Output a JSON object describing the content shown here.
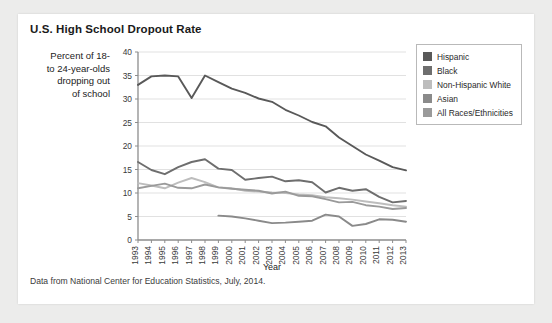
{
  "card": {
    "title": "U.S. High School Dropout Rate",
    "ylabel_line1": "Percent of 18-",
    "ylabel_line2": "to 24-year-olds",
    "ylabel_line3": "dropping out",
    "ylabel_line4": "of school",
    "footnote": "Data from National Center for Education Statistics, July, 2014."
  },
  "legend": {
    "items": [
      {
        "label": "Hispanic",
        "color": "#595959"
      },
      {
        "label": "Black",
        "color": "#6e6e6e"
      },
      {
        "label": "Non-Hispanic White",
        "color": "#bdbdbd"
      },
      {
        "label": "Asian",
        "color": "#8a8a8a"
      },
      {
        "label": "All Races/Ethnicities",
        "color": "#9a9a9a"
      }
    ]
  },
  "chart_data": {
    "type": "line",
    "title": "U.S. High School Dropout Rate",
    "xlabel": "Year",
    "ylabel": "Percent of 18- to 24-year-olds dropping out of school",
    "ylim": [
      0,
      40
    ],
    "yticks": [
      0,
      5,
      10,
      15,
      20,
      25,
      30,
      35,
      40
    ],
    "grid": true,
    "legend_position": "right",
    "categories": [
      "1993",
      "1994",
      "1995",
      "1996",
      "1997",
      "1998",
      "1999",
      "2000",
      "2001",
      "2002",
      "2003",
      "2004",
      "2005",
      "2006",
      "2007",
      "2008",
      "2009",
      "2010",
      "2011",
      "2012",
      "2013"
    ],
    "series": [
      {
        "name": "Hispanic",
        "color": "#595959",
        "values": [
          33.0,
          34.8,
          35.0,
          34.8,
          30.2,
          35.0,
          33.6,
          32.2,
          31.3,
          30.1,
          29.4,
          27.7,
          26.5,
          25.1,
          24.2,
          21.8,
          20.0,
          18.2,
          16.9,
          15.5,
          14.8
        ]
      },
      {
        "name": "Black",
        "color": "#6e6e6e",
        "values": [
          16.6,
          14.9,
          14.0,
          15.5,
          16.6,
          17.2,
          15.2,
          14.9,
          12.8,
          13.2,
          13.5,
          12.5,
          12.7,
          12.3,
          10.1,
          11.1,
          10.5,
          10.8,
          9.2,
          8.0,
          8.3
        ]
      },
      {
        "name": "Non-Hispanic White",
        "color": "#bdbdbd",
        "values": [
          12.1,
          11.6,
          11.0,
          12.2,
          13.2,
          12.3,
          11.2,
          11.0,
          10.5,
          10.3,
          10.1,
          10.0,
          9.7,
          9.5,
          9.1,
          8.9,
          8.6,
          8.2,
          7.8,
          7.4,
          7.1
        ]
      },
      {
        "name": "Asian",
        "color": "#8a8a8a",
        "values": [
          null,
          null,
          null,
          null,
          null,
          null,
          5.2,
          5.0,
          4.6,
          4.1,
          3.6,
          3.7,
          3.9,
          4.1,
          5.4,
          5.0,
          3.0,
          3.4,
          4.4,
          4.3,
          3.9
        ]
      },
      {
        "name": "All Races/Ethnicities",
        "color": "#9a9a9a",
        "values": [
          11.0,
          11.5,
          12.0,
          11.1,
          11.0,
          11.8,
          11.2,
          10.9,
          10.7,
          10.5,
          9.9,
          10.3,
          9.4,
          9.3,
          8.7,
          8.0,
          8.1,
          7.4,
          7.1,
          6.6,
          6.8
        ]
      }
    ]
  }
}
